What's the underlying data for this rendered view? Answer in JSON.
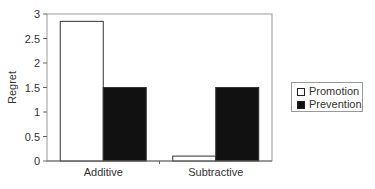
{
  "chart_data": {
    "type": "bar",
    "title": "",
    "xlabel": "",
    "ylabel": "Regret",
    "ylim": [
      0,
      3
    ],
    "yticks": [
      0,
      0.5,
      1,
      1.5,
      2,
      2.5,
      3
    ],
    "ytick_labels": [
      "0",
      "0.5",
      "1",
      "1.5",
      "2",
      "2.5",
      "3"
    ],
    "grid": false,
    "legend_position": "right",
    "categories": [
      "Additive",
      "Subtractive"
    ],
    "series": [
      {
        "name": "Promotion",
        "color": "#ffffff",
        "values": [
          2.85,
          0.1
        ]
      },
      {
        "name": "Prevention",
        "color": "#111111",
        "values": [
          1.5,
          1.5
        ]
      }
    ]
  },
  "legend": {
    "items": [
      {
        "label": "Promotion",
        "color": "#ffffff"
      },
      {
        "label": "Prevention",
        "color": "#111111"
      }
    ]
  }
}
